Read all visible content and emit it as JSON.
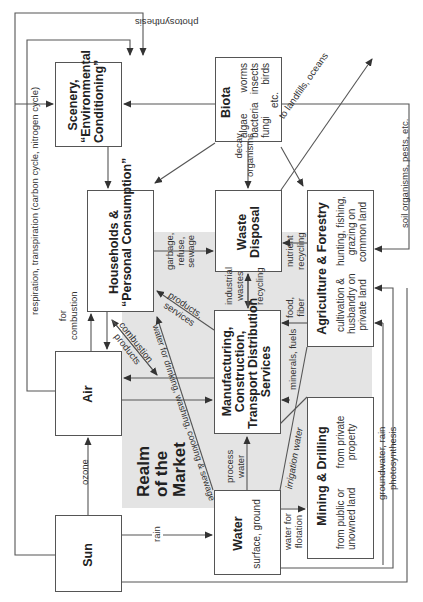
{
  "diagram": {
    "orientation": "rotated 90 degrees counter-clockwise",
    "realm": {
      "label_lines": [
        "Realm",
        "of the",
        "Market"
      ],
      "color": "#e4e4e4"
    },
    "nodes": {
      "scenery": {
        "title_lines": [
          "Scenery,",
          "“Environmental",
          "Conditioning”"
        ]
      },
      "biota": {
        "title": "Biota",
        "examples_col1": [
          "algae",
          "bacteria",
          "fungi"
        ],
        "examples_col2": [
          "worms",
          "insects",
          "birds"
        ],
        "etc": "etc."
      },
      "households": {
        "title_lines": [
          "Households &",
          "“Personal Consumption”"
        ]
      },
      "waste": {
        "title_lines": [
          "Waste",
          "Disposal"
        ]
      },
      "agriculture": {
        "title": "Agriculture & Forestry",
        "sub_left": [
          "cultivation &",
          "husbandry on",
          "private land"
        ],
        "sub_right": [
          "hunting, fishing,",
          "grazing on",
          "common land"
        ]
      },
      "air": {
        "title": "Air"
      },
      "manufacturing": {
        "title_lines": [
          "Manufacturing,",
          "Construction,",
          "Transport Distribution",
          "Services"
        ]
      },
      "mining": {
        "title": "Mining & Drilling",
        "sub_left": [
          "from public or",
          "unowned land"
        ],
        "sub_right": [
          "from private",
          "property"
        ]
      },
      "sun": {
        "title": "Sun"
      },
      "water": {
        "title": "Water",
        "sub": "surface, ground"
      }
    },
    "flow_labels": {
      "photosynthesis_top": "photosynthesis",
      "respiration": "respiration, transpiration (carbon cycle, nitrogen cycle)",
      "for_combustion": [
        "for",
        "combustion"
      ],
      "ozone": "ozone",
      "rain": "rain",
      "decay_organisms": [
        "decay",
        "organisms"
      ],
      "to_landfills": "to landfills, oceans",
      "soil_organisms": "soil organisms, pests, etc.",
      "garbage": [
        "garbage,",
        "refuse,",
        "sewage"
      ],
      "products_services": [
        "products,",
        "services"
      ],
      "combustion_products": [
        "combustion",
        "products"
      ],
      "water_domestic": "water for drinking, washing, cooking & sewage",
      "industrial_wastes": [
        "industrial",
        "wastes"
      ],
      "recycling": "recycling",
      "nutrient_recycling": [
        "nutrient",
        "recycling"
      ],
      "food_fiber": [
        "food,",
        "fiber"
      ],
      "minerals_fuels": "minerals, fuels",
      "process_water": [
        "process",
        "water"
      ],
      "irrigation_water": "irrigation water",
      "water_flotation": [
        "water for",
        "flotation"
      ],
      "groundwater_rain": "groundwater, rain",
      "photosynthesis_right": "photosynthesis"
    }
  }
}
